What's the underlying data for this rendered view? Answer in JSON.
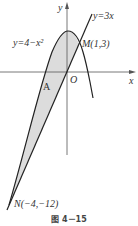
{
  "figure": {
    "caption": "图 4－15",
    "axes": {
      "x_label": "x",
      "y_label": "y",
      "origin_label": "O"
    },
    "curves": [
      {
        "name": "parabola",
        "label": "y=4−x²"
      },
      {
        "name": "line",
        "label": "y=3x"
      }
    ],
    "points": [
      {
        "name": "M",
        "label": "M(1,3)"
      },
      {
        "name": "N",
        "label": "N(−4,−12)"
      }
    ],
    "region_label": "A",
    "colors": {
      "stroke": "#222222",
      "shade": "#d9d9d9",
      "axis": "#555555"
    }
  }
}
